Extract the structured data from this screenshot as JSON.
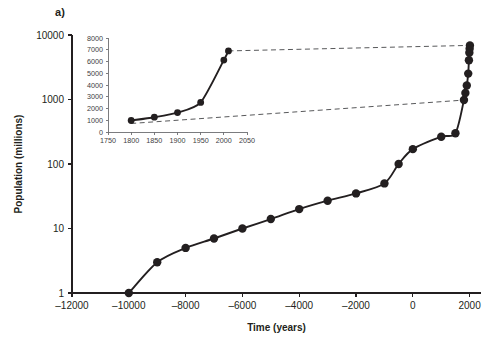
{
  "figure": {
    "panel_label": "a)"
  },
  "chart_data": {
    "type": "line",
    "title": "",
    "xlabel": "Time (years)",
    "ylabel": "Population (millions)",
    "yscale": "log",
    "xlim": [
      -12000,
      2400
    ],
    "ylim": [
      1,
      10000
    ],
    "grid": false,
    "legend": "none",
    "xticks": [
      -12000,
      -10000,
      -8000,
      -6000,
      -4000,
      -2000,
      0,
      2000
    ],
    "xtick_labels": [
      "‒12000",
      "‒10000",
      "‒8000",
      "‒6000",
      "‒4000",
      "‒2000",
      "0",
      "2000"
    ],
    "yticks": [
      1,
      10,
      100,
      1000,
      10000
    ],
    "ytick_labels": [
      "1",
      "10",
      "100",
      "1000",
      "10000"
    ],
    "series": [
      {
        "name": "World population",
        "x": [
          -10000,
          -9000,
          -8000,
          -7000,
          -6000,
          -5000,
          -4000,
          -3000,
          -2000,
          -1000,
          -500,
          0,
          1000,
          1500,
          1800,
          1850,
          1900,
          1950,
          1975,
          1990,
          2000,
          2010
        ],
        "y": [
          1,
          3,
          5,
          7,
          10,
          14,
          20,
          27,
          35,
          50,
          100,
          170,
          265,
          300,
          980,
          1260,
          1650,
          2520,
          4070,
          5320,
          6120,
          6900
        ]
      }
    ]
  },
  "inset_chart_data": {
    "type": "line",
    "title": "",
    "xlabel": "",
    "ylabel": "",
    "yscale": "linear",
    "xlim": [
      1750,
      2050
    ],
    "ylim": [
      0,
      8000
    ],
    "grid": false,
    "legend": "none",
    "xticks": [
      1750,
      1800,
      1850,
      1900,
      1950,
      2000,
      2050
    ],
    "xtick_labels": [
      "1750",
      "1800",
      "1850",
      "1900",
      "1950",
      "2000",
      "2050"
    ],
    "yticks": [
      0,
      1000,
      2000,
      3000,
      4000,
      5000,
      6000,
      7000,
      8000
    ],
    "ytick_labels": [
      "0",
      "1000",
      "2000",
      "3000",
      "4000",
      "5000",
      "6000",
      "7000",
      "8000"
    ],
    "series": [
      {
        "name": "World population (recent)",
        "x": [
          1800,
          1850,
          1900,
          1950,
          2000,
          2010
        ],
        "y": [
          980,
          1260,
          1650,
          2520,
          6120,
          6900
        ]
      }
    ]
  },
  "connectors": {
    "upper_label": "inset-top-connector",
    "lower_label": "inset-bottom-connector"
  }
}
